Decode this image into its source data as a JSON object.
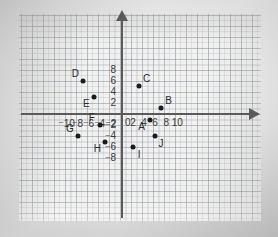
{
  "chart_data": {
    "type": "scatter",
    "title": "",
    "xlabel": "",
    "ylabel": "",
    "xlim": [
      -11,
      11
    ],
    "ylim": [
      -9,
      9
    ],
    "grid": true,
    "minor_grid": true,
    "legend": "none",
    "x_ticks": [
      -10,
      -8,
      -6,
      -4,
      -2,
      0,
      2,
      4,
      6,
      8,
      10
    ],
    "y_ticks": [
      8,
      6,
      4,
      2,
      0,
      -2,
      -4,
      -6,
      -8
    ],
    "x_tick_labels": [
      "⁻10",
      "⁻8",
      "⁻6",
      "⁻4",
      "⁻2",
      "0",
      "2",
      "4",
      "6",
      "8",
      "10"
    ],
    "y_tick_labels": [
      "8",
      "6",
      "4",
      "2",
      "0",
      "⁻2",
      "⁻4",
      "⁻6",
      "⁻8"
    ],
    "origin_label": "0",
    "points": [
      {
        "label": "A",
        "x": 5,
        "y": -1,
        "label_pos": "below-left"
      },
      {
        "label": "B",
        "x": 7,
        "y": 1,
        "label_pos": "above-right"
      },
      {
        "label": "C",
        "x": 3,
        "y": 5,
        "label_pos": "above-right"
      },
      {
        "label": "D",
        "x": -7,
        "y": 6,
        "label_pos": "above-left"
      },
      {
        "label": "E",
        "x": -5,
        "y": 3,
        "label_pos": "below-left"
      },
      {
        "label": "F",
        "x": -4,
        "y": -2,
        "label_pos": "above-left"
      },
      {
        "label": "G",
        "x": -8,
        "y": -4,
        "label_pos": "above-left"
      },
      {
        "label": "H",
        "x": -3,
        "y": -5,
        "label_pos": "below-left"
      },
      {
        "label": "I",
        "x": 2,
        "y": -6,
        "label_pos": "below-right"
      },
      {
        "label": "J",
        "x": 6,
        "y": -4,
        "label_pos": "below-right"
      }
    ]
  },
  "colors": {
    "point": "#1b1b1b",
    "axis": "#5a5a5a",
    "grid": "#8390a0",
    "paper": "#f2f2f0",
    "label": "#2a2a2a"
  }
}
